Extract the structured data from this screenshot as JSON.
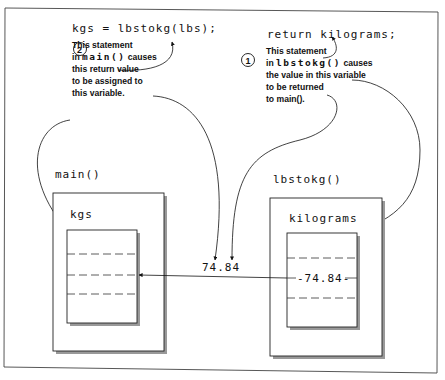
{
  "top_left_statement": "kgs = lbstokg(lbs);",
  "top_right_statement": "return kilograms;",
  "annotation_2": {
    "number": "2",
    "line1": "This statement",
    "line2_prefix": "in ",
    "line2_code": "main()",
    "line2_suffix": " causes",
    "line3": "this return value",
    "line4": "to be assigned to",
    "line5": "this variable."
  },
  "annotation_1": {
    "number": "1",
    "line1": "This statement",
    "line2_prefix": "in ",
    "line2_code": "lbstokg()",
    "line2_suffix": " causes",
    "line3": "the value in this variable",
    "line4": "to be returned",
    "line5": "to main()."
  },
  "main_function": {
    "label": "main()",
    "variable_name": "kgs"
  },
  "lbstokg_function": {
    "label": "lbstokg()",
    "variable_name": "kilograms",
    "stored_value": "-74.84-"
  },
  "returned_value": "74.84"
}
